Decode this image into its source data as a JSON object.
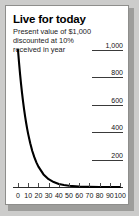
{
  "card": {
    "title": "Live for today",
    "subtitle_lines": [
      "Present value of $1,000",
      "discounted at 10%",
      "received in year"
    ]
  },
  "chart_data": {
    "type": "line",
    "title": "Live for today",
    "subtitle": "Present value of $1,000 discounted at 10% received in year",
    "xlabel": "",
    "ylabel": "",
    "xlim": [
      0,
      100
    ],
    "ylim": [
      0,
      1000
    ],
    "grid": false,
    "legend": false,
    "x_tick_labels": [
      "0",
      "10",
      "20",
      "30",
      "40",
      "50",
      "60",
      "70",
      "80",
      "90",
      "100"
    ],
    "x_ticks": [
      0,
      10,
      20,
      30,
      40,
      50,
      60,
      70,
      80,
      90,
      100
    ],
    "y_tick_labels": [
      "1,000",
      "800",
      "600",
      "400",
      "200"
    ],
    "y_ticks": [
      1000,
      800,
      600,
      400,
      200
    ],
    "series": [
      {
        "name": "Present value",
        "color": "#000000",
        "x": [
          0,
          1,
          2,
          3,
          4,
          5,
          6,
          7,
          8,
          9,
          10,
          12,
          14,
          16,
          18,
          20,
          25,
          30,
          35,
          40,
          45,
          50,
          60,
          70,
          80,
          90,
          100
        ],
        "values": [
          1000,
          909,
          826,
          751,
          683,
          621,
          564,
          513,
          467,
          424,
          386,
          319,
          263,
          218,
          180,
          149,
          92,
          57,
          36,
          22,
          14,
          9,
          3,
          1,
          0.5,
          0.2,
          0.1
        ]
      }
    ]
  }
}
